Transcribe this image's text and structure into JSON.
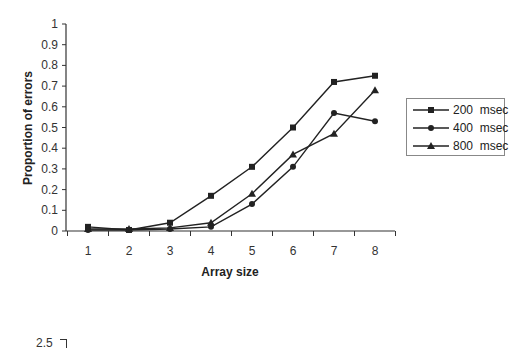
{
  "chart_data": {
    "type": "line",
    "title": "",
    "xlabel": "Array size",
    "ylabel": "Proportion of errors",
    "categories": [
      "1",
      "2",
      "3",
      "4",
      "5",
      "6",
      "7",
      "8"
    ],
    "x": [
      1,
      2,
      3,
      4,
      5,
      6,
      7,
      8
    ],
    "yticks": [
      "0",
      "0.1",
      "0.2",
      "0.3",
      "0.4",
      "0.5",
      "0.6",
      "0.7",
      "0.8",
      "0.9",
      "1"
    ],
    "ylim": [
      0,
      1
    ],
    "grid": false,
    "legend_position": "right",
    "series": [
      {
        "name": "200  msec",
        "marker": "square",
        "values": [
          0.02,
          0.005,
          0.04,
          0.17,
          0.31,
          0.5,
          0.72,
          0.75
        ]
      },
      {
        "name": "400  msec",
        "marker": "circle",
        "values": [
          0.005,
          0.005,
          0.01,
          0.02,
          0.13,
          0.31,
          0.57,
          0.53
        ]
      },
      {
        "name": "800  msec",
        "marker": "triangle",
        "values": [
          0.01,
          0.01,
          0.015,
          0.04,
          0.18,
          0.37,
          0.47,
          0.68
        ]
      }
    ]
  },
  "second_chart": {
    "partial_ytick": "2.5"
  },
  "colors": {
    "line": "#222222",
    "axis": "#333333",
    "background": "#ffffff"
  }
}
